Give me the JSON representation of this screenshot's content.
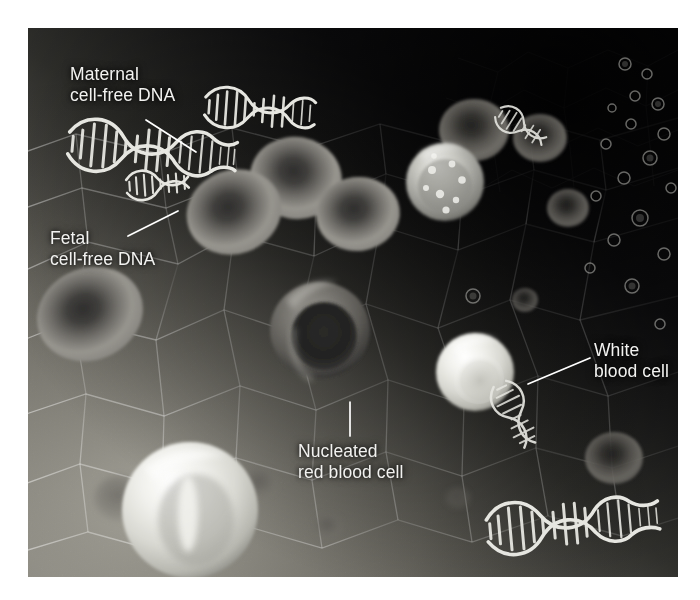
{
  "figure": {
    "kind": "scientific-illustration",
    "canvas": {
      "width": 700,
      "height": 600
    },
    "illustration_frame": {
      "x": 28,
      "y": 28,
      "width": 650,
      "height": 549
    },
    "background_color": "#0b0b0d",
    "page_color": "#ffffff"
  },
  "labels": [
    {
      "id": "maternal",
      "text": "Maternal\ncell-free DNA",
      "color": "#f2f2f0",
      "leader_from": [
        118,
        92
      ],
      "leader_to": [
        168,
        124
      ]
    },
    {
      "id": "fetal",
      "text": "Fetal\ncell-free DNA",
      "color": "#f2f2f0",
      "leader_from": [
        100,
        208
      ],
      "leader_to": [
        150,
        183
      ]
    },
    {
      "id": "nucleated",
      "text": "Nucleated\nred blood cell",
      "color": "#f2f2f0",
      "leader_from": [
        322,
        408
      ],
      "leader_to": [
        322,
        374
      ]
    },
    {
      "id": "white",
      "text": "White\nblood cell",
      "color": "#f2f2f0",
      "leader_from": [
        562,
        330
      ],
      "leader_to": [
        500,
        356
      ]
    }
  ],
  "legend_terms": {
    "maternal_cfdna": "Maternal cell-free DNA",
    "fetal_cfdna": "Fetal cell-free DNA",
    "nucleated_rbc": "Nucleated red blood cell",
    "white_blood_cell": "White blood cell"
  },
  "colors": {
    "background_dark": "#0b0b0d",
    "background_mid": "#3a3a3c",
    "background_light": "#8c8c8a",
    "red_blood_cell": "#8d8b88",
    "red_blood_cell_center": "#3c3b3a",
    "white_blood_cell": "#e9e9e5",
    "dna_strand": "#e2e2de",
    "label_text": "#f2f2f0",
    "leader_line": "#ffffff"
  },
  "elements": {
    "red_blood_cells": [
      {
        "name": "rbc-upper-left",
        "cx": 202,
        "cy": 182,
        "r": 46,
        "rot": -18,
        "fill": "#8a8885"
      },
      {
        "name": "rbc-upper-mid",
        "cx": 268,
        "cy": 152,
        "r": 44,
        "rot": 12,
        "fill": "#8e8c89"
      },
      {
        "name": "rbc-upper-right",
        "cx": 326,
        "cy": 186,
        "r": 40,
        "rot": -6,
        "fill": "#8a8885"
      },
      {
        "name": "rbc-mid-left",
        "cx": 60,
        "cy": 284,
        "r": 50,
        "rot": -24,
        "fill": "#7f7d7a"
      },
      {
        "name": "rbc-small-top",
        "cx": 446,
        "cy": 102,
        "r": 33,
        "rot": 0,
        "fill": "#6f6d6b"
      },
      {
        "name": "rbc-small-top2",
        "cx": 512,
        "cy": 110,
        "r": 26,
        "rot": 0,
        "fill": "#5e5c5a"
      },
      {
        "name": "rbc-small-mid",
        "cx": 540,
        "cy": 180,
        "r": 20,
        "rot": 0,
        "fill": "#55534f"
      },
      {
        "name": "rbc-small-right",
        "cx": 586,
        "cy": 430,
        "r": 28,
        "rot": 0,
        "fill": "#6a6865"
      },
      {
        "name": "rbc-faint-left",
        "cx": 92,
        "cy": 470,
        "r": 24,
        "rot": 0,
        "fill": "#6c6a67"
      },
      {
        "name": "rbc-faint-mid",
        "cx": 232,
        "cy": 455,
        "r": 16,
        "rot": 0,
        "fill": "#78766f"
      }
    ],
    "nucleated_red_blood_cells": [
      {
        "name": "nrbc-center",
        "cx": 292,
        "cy": 302,
        "r": 48,
        "fill": "#6f6d6b",
        "nucleus_fill": "#262625"
      }
    ],
    "white_blood_cells": [
      {
        "name": "wbc-granular-upper",
        "cx": 417,
        "cy": 154,
        "r": 38,
        "fill": "#b9b9b4",
        "granulated": true
      },
      {
        "name": "wbc-right",
        "cx": 447,
        "cy": 344,
        "r": 38,
        "fill": "#dedfda",
        "granulated": false
      },
      {
        "name": "wbc-lower-left",
        "cx": 162,
        "cy": 482,
        "r": 66,
        "fill": "#e7e7e2",
        "granulated": false
      }
    ],
    "dna_strands": [
      {
        "name": "dna-maternal",
        "x": 42,
        "y": 97,
        "length": 172,
        "amp": 17,
        "rot": 6,
        "taper": true
      },
      {
        "name": "dna-upper-mid",
        "x": 178,
        "y": 62,
        "length": 112,
        "amp": 13,
        "rot": 4,
        "taper": true
      },
      {
        "name": "dna-fetal",
        "x": 98,
        "y": 148,
        "length": 68,
        "amp": 9,
        "rot": -4,
        "taper": true
      },
      {
        "name": "dna-right-top",
        "x": 480,
        "y": 82,
        "length": 62,
        "amp": 9,
        "rot": 30,
        "taper": false
      },
      {
        "name": "dna-right-mid",
        "x": 487,
        "y": 360,
        "length": 72,
        "amp": 10,
        "rot": 62,
        "taper": false
      },
      {
        "name": "dna-bottom",
        "x": 462,
        "y": 480,
        "length": 175,
        "amp": 16,
        "rot": -4,
        "taper": true
      }
    ],
    "microparticles": [
      {
        "cx": 597,
        "cy": 36,
        "r": 6
      },
      {
        "cx": 619,
        "cy": 46,
        "r": 5
      },
      {
        "cx": 607,
        "cy": 68,
        "r": 5
      },
      {
        "cx": 630,
        "cy": 76,
        "r": 6
      },
      {
        "cx": 584,
        "cy": 80,
        "r": 4
      },
      {
        "cx": 603,
        "cy": 96,
        "r": 5
      },
      {
        "cx": 636,
        "cy": 106,
        "r": 6
      },
      {
        "cx": 578,
        "cy": 116,
        "r": 5
      },
      {
        "cx": 622,
        "cy": 130,
        "r": 7
      },
      {
        "cx": 596,
        "cy": 150,
        "r": 6
      },
      {
        "cx": 643,
        "cy": 160,
        "r": 5
      },
      {
        "cx": 568,
        "cy": 168,
        "r": 5
      },
      {
        "cx": 612,
        "cy": 190,
        "r": 8
      },
      {
        "cx": 586,
        "cy": 212,
        "r": 6
      },
      {
        "cx": 636,
        "cy": 226,
        "r": 6
      },
      {
        "cx": 562,
        "cy": 240,
        "r": 5
      },
      {
        "cx": 604,
        "cy": 258,
        "r": 7
      },
      {
        "cx": 445,
        "cy": 268,
        "r": 7
      },
      {
        "cx": 632,
        "cy": 296,
        "r": 5
      }
    ]
  }
}
